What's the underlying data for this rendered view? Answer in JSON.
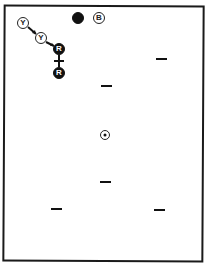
{
  "diagram": {
    "markers": [
      {
        "id": "y1",
        "label": "Y",
        "style": "outline",
        "x": 23,
        "y": 23,
        "size": 12
      },
      {
        "id": "y2",
        "label": "Y",
        "style": "outline",
        "x": 41,
        "y": 38,
        "size": 12
      },
      {
        "id": "r1",
        "label": "R",
        "style": "filled",
        "x": 59,
        "y": 49,
        "size": 12
      },
      {
        "id": "r2",
        "label": "R",
        "style": "filled",
        "x": 59,
        "y": 73,
        "size": 12
      },
      {
        "id": "blackdot",
        "label": "",
        "style": "filled",
        "x": 78,
        "y": 18,
        "size": 12
      },
      {
        "id": "b",
        "label": "B",
        "style": "outline",
        "x": 99,
        "y": 18,
        "size": 12
      }
    ],
    "links": [
      {
        "from": "y1",
        "to": "y2",
        "type": "arrow"
      },
      {
        "from": "y2",
        "to": "r1",
        "type": "arrow"
      },
      {
        "from": "r1",
        "to": "r2",
        "type": "cross"
      }
    ],
    "dashes": [
      {
        "x": 161,
        "y": 59
      },
      {
        "x": 106,
        "y": 86
      },
      {
        "x": 105,
        "y": 182
      },
      {
        "x": 56,
        "y": 209
      },
      {
        "x": 159,
        "y": 210
      }
    ],
    "target": {
      "x": 105,
      "y": 135
    }
  }
}
